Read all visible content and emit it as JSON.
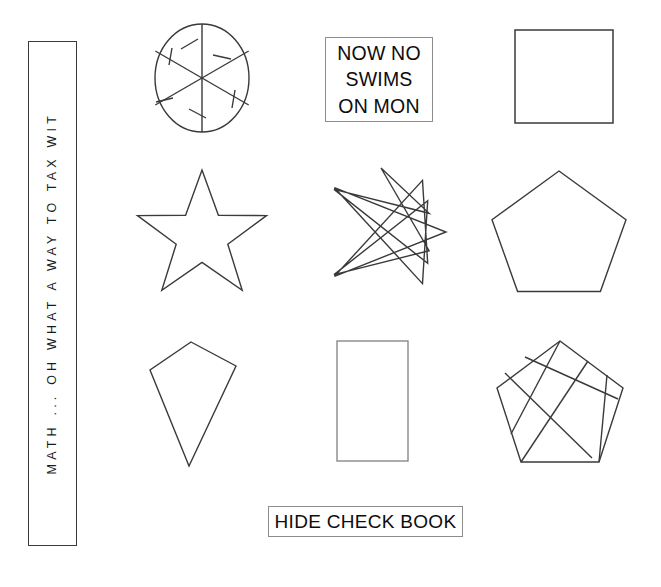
{
  "page": {
    "background_color": "#ffffff",
    "stroke_color": "#333333",
    "text_color": "#111111",
    "width": 661,
    "height": 587
  },
  "vertical_caption": {
    "text": "MATH ... OH WHAT A WAY TO TAX WIT",
    "letters": [
      "M",
      "A",
      "T",
      "H",
      ".",
      ".",
      ".",
      " ",
      "O",
      "H",
      " ",
      "W",
      "H",
      "A",
      "T",
      " ",
      "A",
      " ",
      "W",
      "A",
      "Y",
      " ",
      "T",
      "O",
      " ",
      "T",
      "A",
      "X",
      " ",
      "W",
      "I",
      "T"
    ],
    "orientation": "vertical",
    "border_color": "#3a3a3a"
  },
  "boxes": {
    "now_no": {
      "name": "NOW NO SWIMS ON MON",
      "lines": [
        "NOW NO",
        "SWIMS",
        "ON MON"
      ],
      "border_color": "#8c8c8c"
    },
    "hide_check_book": {
      "name": "HIDE CHECK BOOK",
      "lines": [
        "HIDE CHECK BOOK"
      ],
      "border_color": "#8c8c8c"
    }
  },
  "figures": [
    {
      "id": "spoked-circle",
      "label": "circle with six spokes and arrow barbs",
      "type": "circle-spokes",
      "spokes": 6,
      "stroke": "#333333",
      "row": 1,
      "column": 1
    },
    {
      "id": "square",
      "label": "square",
      "type": "polygon",
      "sides": 4,
      "stroke": "#333333",
      "row": 1,
      "column": 3
    },
    {
      "id": "five-point-star",
      "label": "five pointed star",
      "type": "star",
      "points": 5,
      "stroke": "#333333",
      "row": 2,
      "column": 1
    },
    {
      "id": "eight-point-star",
      "label": "eight pointed star polygon",
      "type": "star-polygon",
      "points": 8,
      "step": 3,
      "stroke": "#333333",
      "row": 2,
      "column": 2
    },
    {
      "id": "pentagon",
      "label": "regular pentagon",
      "type": "polygon",
      "sides": 5,
      "stroke": "#333333",
      "row": 2,
      "column": 3
    },
    {
      "id": "kite",
      "label": "kite quadrilateral",
      "type": "polygon",
      "sides": 4,
      "stroke": "#333333",
      "row": 3,
      "column": 1
    },
    {
      "id": "rectangle",
      "label": "vertical rectangle",
      "type": "polygon",
      "sides": 4,
      "stroke": "#7d7d7d",
      "row": 3,
      "column": 2
    },
    {
      "id": "pentagon-chords",
      "label": "pentagon with crossing chords",
      "type": "polygon-chords",
      "sides": 5,
      "stroke": "#333333",
      "row": 3,
      "column": 3
    }
  ]
}
